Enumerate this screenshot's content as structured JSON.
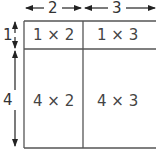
{
  "dimensions": {
    "top": [
      {
        "label": "2"
      },
      {
        "label": "3"
      }
    ],
    "left": [
      {
        "label": "1"
      },
      {
        "label": "4"
      }
    ]
  },
  "cells": [
    [
      "1 × 2",
      "1 × 3"
    ],
    [
      "4 × 2",
      "4 × 3"
    ]
  ]
}
